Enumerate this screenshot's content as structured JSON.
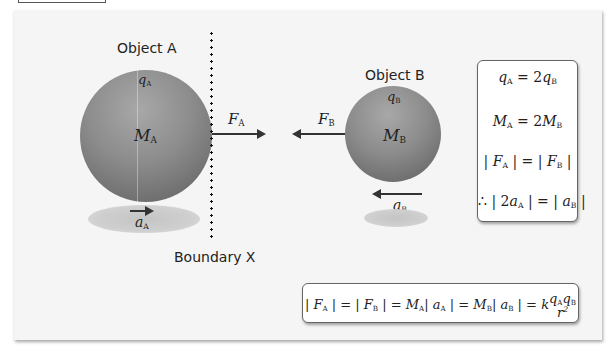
{
  "diagram": {
    "object_a": {
      "title": "Object A",
      "charge_symbol": "q",
      "charge_sub": "A",
      "mass_symbol": "M",
      "mass_sub": "A",
      "force_symbol": "F",
      "force_sub": "A",
      "accel_symbol": "a",
      "accel_sub": "A",
      "force_direction": "right",
      "accel_direction": "right"
    },
    "object_b": {
      "title": "Object B",
      "charge_symbol": "q",
      "charge_sub": "B",
      "mass_symbol": "M",
      "mass_sub": "B",
      "force_symbol": "F",
      "force_sub": "B",
      "accel_symbol": "a",
      "accel_sub": "B",
      "force_direction": "left",
      "accel_direction": "left"
    },
    "boundary_label": "Boundary X",
    "relations_box": {
      "lines": [
        "qA = 2qB",
        "MA = 2MB",
        "|FA| = |FB|",
        "∴ |2aA| = |aB|"
      ]
    },
    "equation_box": {
      "text": "|FA| = |FB| = MA|aA| = MB|aB| = k qA qB / r²"
    },
    "colors": {
      "panel_bg": "#f5f5f5",
      "sphere_mid": "#8a8a8a",
      "sphere_dark": "#5a5a5a",
      "arrow": "#333333"
    }
  }
}
